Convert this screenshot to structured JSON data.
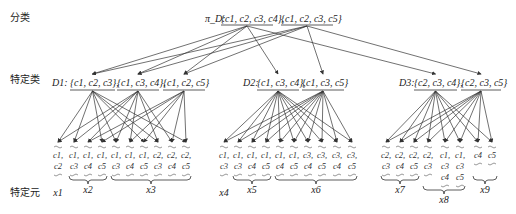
{
  "labels": {
    "level1": "分类",
    "level2": "特定类",
    "level3": "特定元"
  },
  "root": {
    "name": "π_D:",
    "sets": [
      "{c1, c2, c3, c4}",
      "{c1, c2, c3, c5}"
    ]
  },
  "classes": [
    {
      "name": "D1:",
      "sets": [
        "{c1, c2, c3}",
        "{c1, c3, c4}",
        "{c1, c2, c5}"
      ]
    },
    {
      "name": "D2:",
      "sets": [
        "{c1, c3, c4}",
        "{c1, c3, c5}"
      ]
    },
    {
      "name": "D3:",
      "sets": [
        "{c2, c3, c4}",
        "{c2, c3, c5}"
      ]
    }
  ],
  "elements": [
    {
      "group": "x1",
      "columns": [
        [
          "c1",
          "c2"
        ]
      ]
    },
    {
      "group": "x2",
      "columns": [
        [
          "c1",
          "c3"
        ],
        [
          "c1",
          "c4"
        ],
        [
          "c1",
          "c5"
        ]
      ]
    },
    {
      "group": "x3",
      "columns": [
        [
          "c1",
          "c3"
        ],
        [
          "c1",
          "c4"
        ],
        [
          "c1",
          "c5"
        ],
        [
          "c2",
          "c3"
        ],
        [
          "c2",
          "c4"
        ],
        [
          "c2",
          "c5"
        ]
      ]
    },
    {
      "group": "x4",
      "columns": [
        [
          "c1",
          "c3"
        ]
      ]
    },
    {
      "group": "x5",
      "columns": [
        [
          "c1",
          "c3"
        ],
        [
          "c1",
          "c4"
        ],
        [
          "c1",
          "c5"
        ]
      ]
    },
    {
      "group": "x6",
      "columns": [
        [
          "c1",
          "c4"
        ],
        [
          "c1",
          "c5"
        ],
        [
          "c3",
          "c4"
        ],
        [
          "c3",
          "c5"
        ],
        [
          "c3",
          "c4"
        ],
        [
          "c3",
          "c5"
        ]
      ]
    },
    {
      "group": "x7",
      "columns": [
        [
          "c2",
          "c3"
        ],
        [
          "c2",
          "c4"
        ],
        [
          "c2",
          "c5"
        ]
      ]
    },
    {
      "group": "x8",
      "columns": [
        [
          "c2",
          "c3"
        ],
        [
          "c1",
          "c3",
          "c4"
        ],
        [
          "c1",
          "c3",
          "c5"
        ]
      ]
    },
    {
      "group": "x9",
      "columns": [
        [
          "c4"
        ],
        [
          "c5"
        ]
      ]
    }
  ]
}
